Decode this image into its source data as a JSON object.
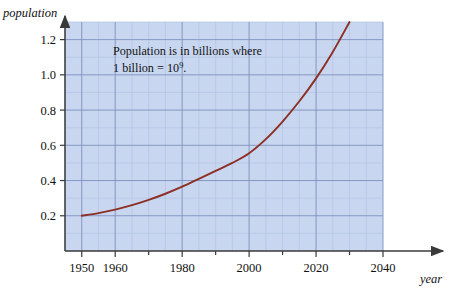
{
  "figure": {
    "background_color": "#ffffff",
    "plot_background_color": "#c8d6ef",
    "minor_grid_color": "#b3c4e4",
    "major_grid_color": "#7e91bf",
    "axis_color": "#3a3a3a",
    "curve_color": "#8c2f24"
  },
  "annotation": {
    "line1": "Population is in billions where",
    "line2_prefix": "1 billion = 10",
    "line2_exponent": "9",
    "line2_suffix": "."
  },
  "axes": {
    "y_title": "population",
    "x_title": "year"
  },
  "chart_data": {
    "type": "line",
    "title": "",
    "xlabel": "year",
    "ylabel": "population",
    "xlim": [
      1945,
      2040
    ],
    "ylim": [
      0.0,
      1.3
    ],
    "x_ticks": [
      1950,
      1960,
      1980,
      2000,
      2020,
      2040
    ],
    "x_tick_labels": [
      "1950",
      "1960",
      "1980",
      "2000",
      "2020",
      "2040"
    ],
    "x_minor_step": 5,
    "y_ticks": [
      0.2,
      0.4,
      0.6,
      0.8,
      1.0,
      1.2
    ],
    "y_tick_labels": [
      "0.2",
      "0.4",
      "0.6",
      "0.8",
      "1.0",
      "1.2"
    ],
    "y_minor_step": 0.1,
    "grid": true,
    "legend": "none",
    "series": [
      {
        "name": "population",
        "units": "billions",
        "x": [
          1950,
          1955,
          1960,
          1965,
          1970,
          1975,
          1980,
          1985,
          1990,
          1995,
          2000,
          2005,
          2010,
          2015,
          2020,
          2025,
          2030
        ],
        "y": [
          0.2,
          0.215,
          0.235,
          0.26,
          0.29,
          0.325,
          0.365,
          0.41,
          0.455,
          0.5,
          0.555,
          0.635,
          0.735,
          0.85,
          0.98,
          1.13,
          1.3
        ]
      }
    ],
    "annotations": [
      {
        "text": "Population is in billions where 1 billion = 10^9.",
        "x": 1968,
        "y": 1.13
      }
    ]
  }
}
